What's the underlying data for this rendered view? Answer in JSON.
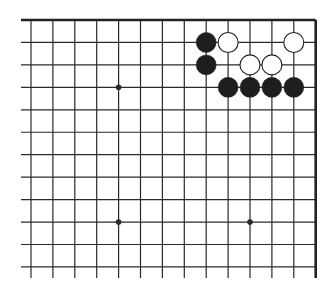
{
  "diagram": {
    "type": "go-board-fragment",
    "visible_region": "upper-right corner of 19x19 board",
    "grid": {
      "columns": 14,
      "rows": 12,
      "origin_x": 31,
      "origin_y": 20,
      "spacing_x": 21.9,
      "spacing_y": 22.45,
      "line_extend_bottom": 11,
      "line_extend_left": 10,
      "edges": [
        "top",
        "right"
      ]
    },
    "star_points": [
      {
        "col": 4,
        "row": 3
      },
      {
        "col": 4,
        "row": 9
      },
      {
        "col": 10,
        "row": 9
      }
    ],
    "stones": [
      {
        "color": "black",
        "col": 8,
        "row": 1
      },
      {
        "color": "white",
        "col": 9,
        "row": 1
      },
      {
        "color": "white",
        "col": 12,
        "row": 1
      },
      {
        "color": "black",
        "col": 8,
        "row": 2
      },
      {
        "color": "white",
        "col": 10,
        "row": 2
      },
      {
        "color": "white",
        "col": 11,
        "row": 2
      },
      {
        "color": "black",
        "col": 9,
        "row": 3
      },
      {
        "color": "black",
        "col": 10,
        "row": 3
      },
      {
        "color": "black",
        "col": 11,
        "row": 3
      },
      {
        "color": "black",
        "col": 12,
        "row": 3
      }
    ],
    "colors": {
      "line": "#2a2a2a",
      "edge": "#222222",
      "black_stone": "#1e1e1e",
      "white_stone": "#ffffff",
      "background": "#ffffff"
    },
    "stone_radius": 10
  }
}
